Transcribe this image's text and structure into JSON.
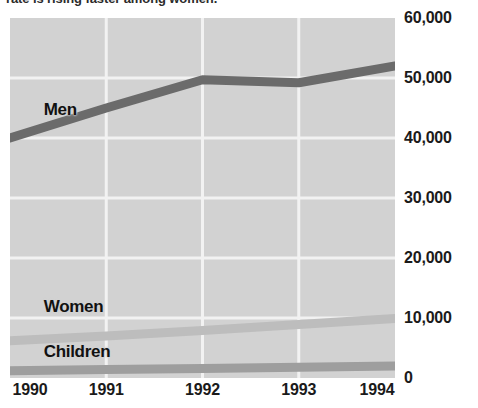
{
  "title": "rate is rising faster among women.",
  "chart_data": {
    "type": "line",
    "title": "rate is rising faster among women.",
    "xlabel": "",
    "ylabel": "",
    "categories": [
      "1990",
      "1991",
      "1992",
      "1993",
      "1994"
    ],
    "x": [
      1990,
      1991,
      1992,
      1993,
      1994
    ],
    "ylim": [
      0,
      60000
    ],
    "y_ticks": [
      "0",
      "10,000",
      "20,000",
      "30,000",
      "40,000",
      "50,000",
      "60,000"
    ],
    "y_tick_values": [
      0,
      10000,
      20000,
      30000,
      40000,
      50000,
      60000
    ],
    "grid": true,
    "legend_position": "inline-labels",
    "plot_background": "#d2d2d2",
    "gridline_color": "#f2f2f2",
    "series": [
      {
        "name": "Men",
        "color": "#6b6b6b",
        "values": [
          40000,
          45000,
          49700,
          49200,
          52000
        ],
        "label_x": 1990.35,
        "label_y": 44500
      },
      {
        "name": "Women",
        "color": "#bdbdbd",
        "values": [
          6200,
          7000,
          7900,
          8900,
          9900
        ],
        "label_x": 1990.35,
        "label_y": 11600
      },
      {
        "name": "Children",
        "color": "#9e9e9e",
        "values": [
          1200,
          1400,
          1600,
          1800,
          2000
        ],
        "label_x": 1990.35,
        "label_y": 4200
      }
    ]
  }
}
